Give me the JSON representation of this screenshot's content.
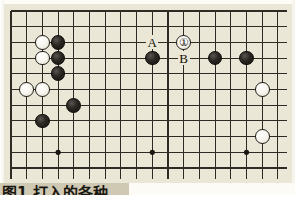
{
  "figure": {
    "type": "go-board-diagram",
    "caption": "图1  打入的各种",
    "board": {
      "columns": 18,
      "rows": 11,
      "origin_x": 11,
      "origin_y": 11,
      "spacing": 15.7,
      "line_color": "#2e2b24",
      "board_color": "#eae7d7",
      "star_points": [
        {
          "col": 3,
          "row": 9
        },
        {
          "col": 9,
          "row": 9
        },
        {
          "col": 15,
          "row": 9
        }
      ]
    },
    "stones": [
      {
        "id": "w-c2r2",
        "color": "white",
        "col": 2,
        "row": 2,
        "number": null
      },
      {
        "id": "b-c3r2",
        "color": "black",
        "col": 3,
        "row": 2,
        "number": null
      },
      {
        "id": "w-c2r3",
        "color": "white",
        "col": 2,
        "row": 3,
        "number": null
      },
      {
        "id": "b-c3r3",
        "color": "black",
        "col": 3,
        "row": 3,
        "number": null
      },
      {
        "id": "b-c3r4",
        "color": "black",
        "col": 3,
        "row": 4,
        "number": null
      },
      {
        "id": "w-c1r5",
        "color": "white",
        "col": 1,
        "row": 5,
        "number": null
      },
      {
        "id": "w-c2r5",
        "color": "white",
        "col": 2,
        "row": 5,
        "number": null
      },
      {
        "id": "b-c4r6",
        "color": "black",
        "col": 4,
        "row": 6,
        "number": null
      },
      {
        "id": "b-c2r7",
        "color": "black",
        "col": 2,
        "row": 7,
        "number": null
      },
      {
        "id": "b-c9r3",
        "color": "black",
        "col": 9,
        "row": 3,
        "number": null
      },
      {
        "id": "w-c11r2",
        "color": "white",
        "col": 11,
        "row": 2,
        "number": "①"
      },
      {
        "id": "b-c13r3",
        "color": "black",
        "col": 13,
        "row": 3,
        "number": null
      },
      {
        "id": "b-c15r3",
        "color": "black",
        "col": 15,
        "row": 3,
        "number": null
      },
      {
        "id": "w-c16r5",
        "color": "white",
        "col": 16,
        "row": 5,
        "number": null
      },
      {
        "id": "w-c16r8",
        "color": "white",
        "col": 16,
        "row": 8,
        "number": null
      }
    ],
    "point_labels": [
      {
        "id": "label-a",
        "text": "A",
        "col": 9,
        "row": 2
      },
      {
        "id": "label-b",
        "text": "B",
        "col": 11,
        "row": 3
      }
    ]
  }
}
